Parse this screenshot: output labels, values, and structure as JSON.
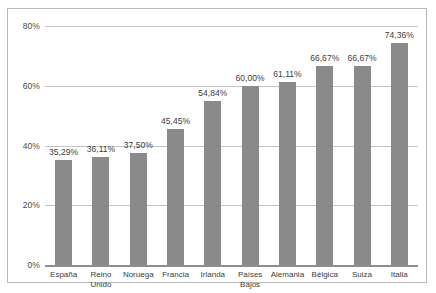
{
  "chart_data": {
    "type": "bar",
    "title": "",
    "subtitle": "",
    "xlabel": "",
    "ylabel": "",
    "ylim": [
      0,
      80
    ],
    "grid": true,
    "legend": "none",
    "y_ticks": [
      "0%",
      "20%",
      "40%",
      "60%",
      "80%"
    ],
    "y_tick_values": [
      0,
      20,
      40,
      60,
      80
    ],
    "categories": [
      "España",
      "Reino\nUnido",
      "Noruega",
      "Francia",
      "Irlanda",
      "Países\nBajos",
      "Alemania",
      "Bélgica",
      "Suiza",
      "Italia"
    ],
    "values": [
      35.29,
      36.11,
      37.5,
      45.45,
      54.84,
      60.0,
      61.11,
      66.67,
      66.67,
      74.36
    ],
    "data_labels": [
      "35,29%",
      "36,11%",
      "37,50%",
      "45,45%",
      "54,84%",
      "60,00%",
      "61,11%",
      "66,67%",
      "66,67%",
      "74,36%"
    ],
    "colors": {
      "bar": "#8a8a8a",
      "gridline": "#c4c4c4",
      "baseline": "#8e8e8e",
      "border": "#b9b9b9",
      "text": "#3c3c3c",
      "background": "#ffffff"
    }
  }
}
